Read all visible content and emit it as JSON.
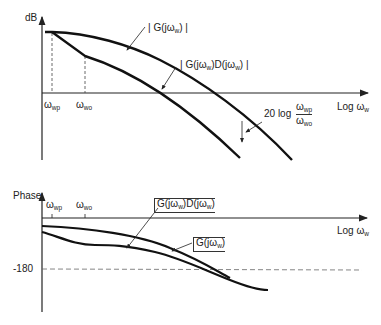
{
  "magnitude_plot": {
    "y_axis_label": "dB",
    "x_axis_label": "Log ω",
    "x_axis_sub": "w",
    "tick_wp": "ω",
    "tick_wp_sub": "wp",
    "tick_wo": "ω",
    "tick_wo_sub": "wo",
    "curve_g_label": "| G(jω",
    "curve_g_label_sub": "w",
    "curve_g_label_end": ") |",
    "curve_gd_label": "| G(jω",
    "curve_gd_label_sub1": "w",
    "curve_gd_label_mid": ")D(jω",
    "curve_gd_label_sub2": "w",
    "curve_gd_label_end": ") |",
    "annotation_prefix": "20 log",
    "annotation_num": "ω",
    "annotation_num_sub": "wp",
    "annotation_den": "ω",
    "annotation_den_sub": "wo"
  },
  "phase_plot": {
    "y_axis_label": "Phase",
    "x_axis_label": "Log ω",
    "x_axis_sub": "w",
    "tick_wp": "ω",
    "tick_wp_sub": "wp",
    "tick_wo": "ω",
    "tick_wo_sub": "wo",
    "y_tick_value": "-180",
    "curve_gd_label": "G(jω",
    "curve_gd_label_sub1": "w",
    "curve_gd_label_mid": ")D(jω",
    "curve_gd_label_sub2": "w",
    "curve_gd_label_end": ")",
    "curve_g_label": "G(jω",
    "curve_g_label_sub": "w",
    "curve_g_label_end": ")"
  }
}
